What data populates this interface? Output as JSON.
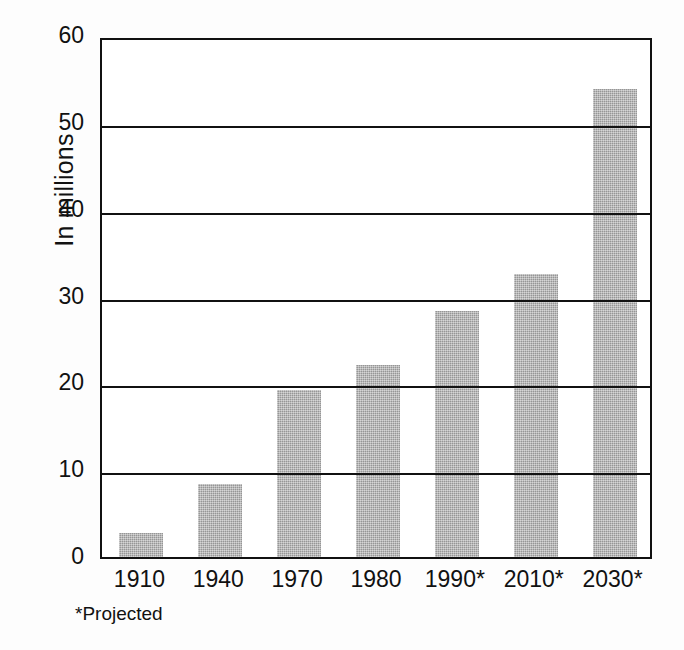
{
  "chart_data": {
    "type": "bar",
    "title": "",
    "subtitle": "",
    "xlabel": "",
    "ylabel": "In millions",
    "categories": [
      "1910",
      "1940",
      "1970",
      "1980",
      "1990*",
      "2010*",
      "2030*"
    ],
    "values": [
      2.8,
      8.4,
      19.2,
      22.1,
      28.3,
      32.6,
      53.9
    ],
    "ylim": [
      0,
      60
    ],
    "ytick_labels": [
      "0",
      "10",
      "20",
      "30",
      "40",
      "50",
      "60"
    ],
    "ytick_values": [
      0,
      10,
      20,
      30,
      40,
      50,
      60
    ],
    "grid": "horizontal",
    "legend": "none",
    "annotations": [
      "*Projected"
    ],
    "bar_color": "#a9a9a9",
    "axis_color": "#111111",
    "background_color": "#ffffff"
  },
  "figure": {
    "y_axis_title": "In millions",
    "footnote": "*Projected"
  }
}
